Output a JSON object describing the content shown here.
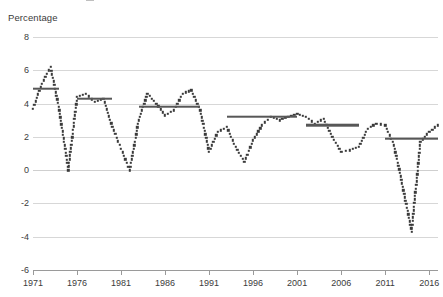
{
  "chart_data": {
    "type": "line",
    "title": "",
    "subtitle": "",
    "xlabel": "",
    "ylabel": "Percentage",
    "ylim": [
      -6,
      8
    ],
    "xlim": [
      1971,
      2017
    ],
    "grid": true,
    "legend": "none",
    "y_ticks": [
      8,
      6,
      4,
      2,
      0,
      -2,
      -4,
      -6
    ],
    "y_tick_labels": [
      "8",
      "6",
      "4",
      "2",
      "0",
      "-2",
      "-4",
      "-6"
    ],
    "x_ticks": [
      1971,
      1976,
      1981,
      1986,
      1991,
      1996,
      2001,
      2006,
      2011,
      2016
    ],
    "x_tick_labels": [
      "1971",
      "1976",
      "1981",
      "1986",
      "1991",
      "1996",
      "2001",
      "2006",
      "2011",
      "2016"
    ],
    "series": [
      {
        "name": "Annual percentage change",
        "style": "dotted",
        "color": "#3a3a3a",
        "x": [
          1971,
          1972,
          1973,
          1974,
          1975,
          1976,
          1977,
          1978,
          1979,
          1980,
          1981,
          1982,
          1983,
          1984,
          1985,
          1986,
          1987,
          1988,
          1989,
          1990,
          1991,
          1992,
          1993,
          1994,
          1995,
          1996,
          1997,
          1998,
          1999,
          2000,
          2001,
          2002,
          2003,
          2004,
          2005,
          2006,
          2007,
          2008,
          2009,
          2010,
          2011,
          2012,
          2013,
          2014,
          2015,
          2016,
          2017
        ],
        "values": [
          3.7,
          5.2,
          6.2,
          3.6,
          0.0,
          4.4,
          4.6,
          4.1,
          4.3,
          2.6,
          1.3,
          0.0,
          3.0,
          4.6,
          4.0,
          3.3,
          3.6,
          4.6,
          4.8,
          3.6,
          1.1,
          2.3,
          2.6,
          1.4,
          0.5,
          1.8,
          2.7,
          3.2,
          3.0,
          3.2,
          3.4,
          3.2,
          2.8,
          3.1,
          2.0,
          1.1,
          1.2,
          1.4,
          2.5,
          2.8,
          2.7,
          1.5,
          -1.0,
          -3.7,
          1.7,
          2.3,
          2.7
        ],
        "note": "values estimated from dotted series positions"
      },
      {
        "name": "Period averages",
        "style": "solid-horizontal",
        "color": "#575757",
        "segments": [
          {
            "start": 1971,
            "end": 1974,
            "value": 4.9
          },
          {
            "start": 1976,
            "end": 1980,
            "value": 4.3
          },
          {
            "start": 1983,
            "end": 1990,
            "value": 3.8
          },
          {
            "start": 1993,
            "end": 2001,
            "value": 3.2
          },
          {
            "start": 2002,
            "end": 2008,
            "value": 2.7
          },
          {
            "start": 2011,
            "end": 2017,
            "value": 1.9
          }
        ]
      }
    ]
  }
}
